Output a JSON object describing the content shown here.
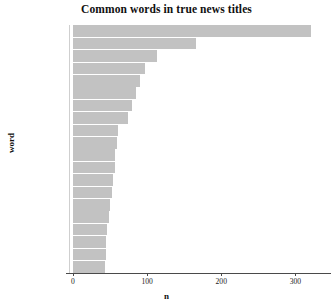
{
  "chart_data": {
    "type": "bar",
    "orientation": "horizontal",
    "title": "Common words in true news titles",
    "xlabel": "n",
    "ylabel": "word",
    "categories": [
      "china",
      "outbreak",
      "health",
      "beer",
      "wuhan",
      "due",
      "chinese",
      "people",
      "spread",
      "death",
      "amid",
      "threat",
      "toll",
      "confirmed",
      "emergency",
      "infected",
      "global",
      "hospital",
      "news",
      "doh"
    ],
    "values": [
      321,
      166,
      113,
      97,
      90,
      85,
      80,
      74,
      61,
      59,
      57,
      56,
      54,
      52,
      50,
      48,
      46,
      45,
      44,
      43
    ],
    "xlim": [
      0,
      348
    ],
    "xticks": [
      0,
      100,
      200,
      300
    ],
    "xtick_labels": [
      "0",
      "100",
      "200",
      "300"
    ],
    "grid": false,
    "legend": "none",
    "bar_color": "#c2c2c2",
    "background": "#ffffff"
  }
}
